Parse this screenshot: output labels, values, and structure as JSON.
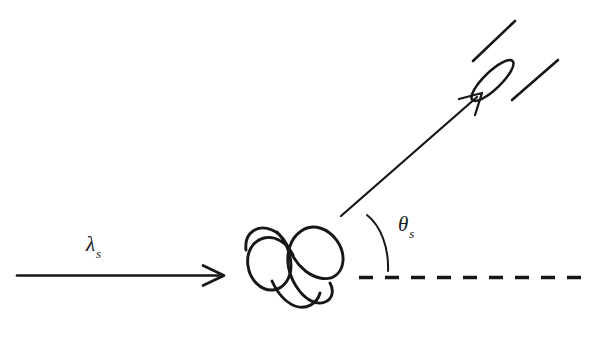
{
  "figure": {
    "type": "schematic-diagram",
    "background_color": "#ffffff",
    "ink_color": "#17171a",
    "width": 592,
    "height": 338
  },
  "labels": {
    "incident_wavelength": {
      "symbol": "λ",
      "subscript": "s",
      "x": 86,
      "y": 232
    },
    "scattering_angle": {
      "symbol": "θ",
      "subscript": "s",
      "x": 398,
      "y": 212
    }
  },
  "elements": {
    "incident_beam": {
      "name": "incident-beam-arrow",
      "from": [
        17,
        275
      ],
      "to": [
        224,
        275
      ],
      "stroke_width": 2.6,
      "arrowhead": "open-v"
    },
    "scattered_beam": {
      "name": "scattered-beam-arrow",
      "from": [
        341,
        216
      ],
      "to": [
        482,
        93
      ],
      "stroke_width": 2.2,
      "arrowhead": "open-v"
    },
    "reference_axis": {
      "name": "dashed-reference-axis",
      "from": [
        358,
        277
      ],
      "to": [
        586,
        277
      ],
      "stroke_width": 3.2,
      "dash_pattern": "14 12",
      "dash_count": 9
    },
    "angle_arc": {
      "name": "scattering-angle-arc",
      "from": [
        367,
        215
      ],
      "to": [
        388,
        271
      ],
      "stroke_width": 1.9
    },
    "scatterer": {
      "name": "polymer-coil",
      "description": "tangled random-coil squiggle with four lobes",
      "center": [
        295,
        268
      ],
      "stroke_width": 2.8
    },
    "detector": {
      "name": "detector-cone",
      "description": "conical detector aperture pointing down-left toward the sample",
      "aperture_ellipse": {
        "center": [
          492,
          80
        ],
        "rx": 28,
        "ry": 8,
        "rotation_deg": -45
      },
      "wall_upper": {
        "from": [
          473,
          61
        ],
        "to": [
          514,
          22
        ]
      },
      "wall_lower": {
        "from": [
          512,
          100
        ],
        "to": [
          557,
          61
        ]
      },
      "stroke_width": 2.6
    }
  }
}
